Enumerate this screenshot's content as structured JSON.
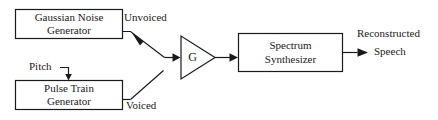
{
  "diagram": {
    "colors": {
      "background": "#ffffff",
      "stroke": "#1a1a1a",
      "text": "#1a1a1a"
    },
    "blocks": [
      {
        "id": "gaussian-noise-generator",
        "line1": "Gaussian Noise",
        "line2": "Generator"
      },
      {
        "id": "pulse-train-generator",
        "line1": "Pulse Train",
        "line2": "Generator"
      },
      {
        "id": "spectrum-synthesizer",
        "line1": "Spectrum",
        "line2": "Synthesizer"
      }
    ],
    "gain": {
      "id": "gain-amplifier",
      "symbol": "G"
    },
    "labels": {
      "unvoiced": "Unvoiced",
      "voiced": "Voiced",
      "pitch": "Pitch",
      "output_line1": "Reconstructed",
      "output_line2": "Speech"
    }
  }
}
